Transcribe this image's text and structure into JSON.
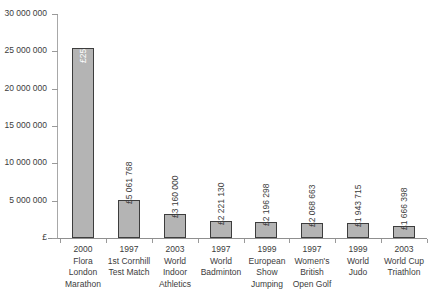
{
  "chart_data": {
    "type": "bar",
    "title": "",
    "xlabel": "",
    "ylabel": "£",
    "ylim": [
      0,
      30000000
    ],
    "grid": false,
    "legend": null,
    "currency_symbol": "£",
    "y_ticks": [
      "30 000 000",
      "25 000 000",
      "20 000 000",
      "15 000 000",
      "10 000 000",
      "5 000 000",
      "£"
    ],
    "y_tick_values": [
      30000000,
      25000000,
      20000000,
      15000000,
      10000000,
      5000000,
      0
    ],
    "categories": [
      "2000 Flora London Marathon",
      "1997 1st Cornhill Test Match",
      "2003 World Indoor Athletics",
      "1997 World Badminton",
      "1999 European Show Jumping",
      "1997 Women's British Open Golf",
      "1999 World Judo",
      "2003 World Cup Triathlon"
    ],
    "category_lines": [
      [
        "2000",
        "Flora",
        "London",
        "Marathon"
      ],
      [
        "1997",
        "1st Cornhill",
        "Test Match"
      ],
      [
        "2003",
        "World",
        "Indoor",
        "Athletics"
      ],
      [
        "1997",
        "World",
        "Badminton"
      ],
      [
        "1999",
        "European",
        "Show",
        "Jumping"
      ],
      [
        "1997",
        "Women's",
        "British",
        "Open Golf"
      ],
      [
        "1999",
        "World",
        "Judo"
      ],
      [
        "2003",
        "World Cup",
        "Triathlon"
      ]
    ],
    "values": [
      25459187,
      5061768,
      3160000,
      2221130,
      2196298,
      2068663,
      1943715,
      1666398
    ],
    "value_labels": [
      "£25 459 187",
      "£5 061 768",
      "£3 160 000",
      "£2 221 130",
      "£2 196 298",
      "£2 068 663",
      "£1 943 715",
      "£1 666 398"
    ],
    "colors": {
      "bar_fill": "#b4b4b4",
      "bar_border": "#3d3d3d",
      "axis": "#8f8f8f",
      "text": "#3c3c3c",
      "inside_label": "#ffffff",
      "background": "#ffffff"
    }
  }
}
